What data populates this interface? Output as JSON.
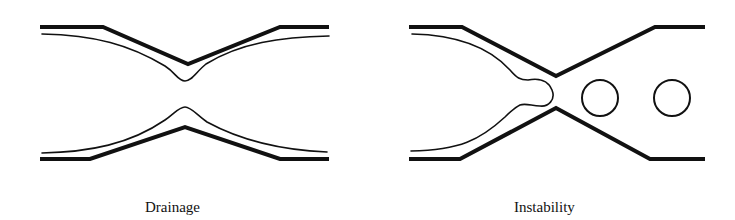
{
  "figure": {
    "panels": [
      {
        "id": "drainage",
        "caption": "Drainage",
        "elements": [
          "channel-walls",
          "liquid-film-top",
          "liquid-film-bottom"
        ]
      },
      {
        "id": "instability",
        "caption": "Instability",
        "elements": [
          "channel-walls",
          "liquid-film-with-collar",
          "bubble",
          "bubble"
        ]
      }
    ],
    "colors": {
      "stroke": "#111111",
      "background": "#ffffff"
    }
  }
}
